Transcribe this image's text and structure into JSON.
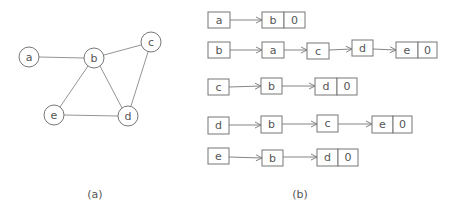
{
  "graph": {
    "caption": "(a)",
    "nodes": [
      {
        "id": "a",
        "label": "a",
        "x": 29,
        "y": 57
      },
      {
        "id": "b",
        "label": "b",
        "x": 94,
        "y": 58
      },
      {
        "id": "c",
        "label": "c",
        "x": 151,
        "y": 42
      },
      {
        "id": "d",
        "label": "d",
        "x": 128,
        "y": 116
      },
      {
        "id": "e",
        "label": "e",
        "x": 54,
        "y": 115
      }
    ],
    "edges": [
      [
        "a",
        "b"
      ],
      [
        "b",
        "c"
      ],
      [
        "b",
        "e"
      ],
      [
        "b",
        "d"
      ],
      [
        "c",
        "d"
      ],
      [
        "e",
        "d"
      ]
    ]
  },
  "adjacency": {
    "caption": "(b)",
    "null_label": "0",
    "rows": [
      {
        "head": "a",
        "list": [
          "b"
        ]
      },
      {
        "head": "b",
        "list": [
          "a",
          "c",
          "d",
          "e"
        ]
      },
      {
        "head": "c",
        "list": [
          "b",
          "d"
        ]
      },
      {
        "head": "d",
        "list": [
          "b",
          "c",
          "e"
        ]
      },
      {
        "head": "e",
        "list": [
          "b",
          "d"
        ]
      }
    ]
  }
}
